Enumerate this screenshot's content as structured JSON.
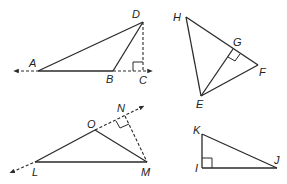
{
  "figures": [
    {
      "id": "triangle-ABD",
      "labels": {
        "A": "A",
        "B": "B",
        "C": "C",
        "D": "D"
      },
      "description": "Obtuse triangle ABD with altitude DC drawn outside to extended line AB; right angle at C"
    },
    {
      "id": "triangle-EFH",
      "labels": {
        "H": "H",
        "G": "G",
        "F": "F",
        "E": "E"
      },
      "description": "Triangle EFH with altitude EG to side HF; right angle at G"
    },
    {
      "id": "triangle-LMO",
      "labels": {
        "L": "L",
        "M": "M",
        "N": "N",
        "O": "O"
      },
      "description": "Obtuse triangle LMO with altitude MN drawn outside to extended line LO; right angle at N"
    },
    {
      "id": "triangle-IJK",
      "labels": {
        "K": "K",
        "I": "I",
        "J": "J"
      },
      "description": "Right triangle IJK with right angle at I"
    }
  ],
  "colors": {
    "stroke": "#2a2a2a",
    "background": "#ffffff"
  }
}
